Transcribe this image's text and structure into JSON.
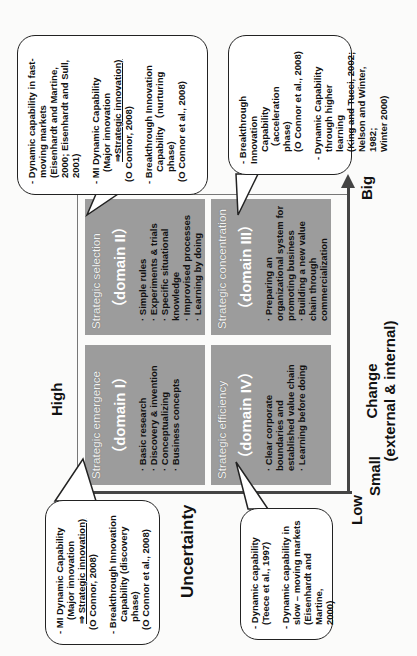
{
  "diagram": {
    "axes": {
      "x_axis": {
        "title": "Change",
        "subtitle": "(external & internal)",
        "low_label": "Small",
        "high_label": "Big"
      },
      "y_axis": {
        "title": "Uncertainty",
        "low_label": "Low",
        "high_label": "High"
      }
    },
    "quadrants": [
      {
        "id": "I",
        "title": "Strategic emergence",
        "domain": "（domain I）",
        "items": [
          "Basic research",
          "Discovery & invention",
          "Conceptualizing",
          "Business concepts"
        ]
      },
      {
        "id": "II",
        "title": "Strategic selection",
        "domain": "（domain II）",
        "items": [
          "Simple rules",
          "Experiments & trials",
          "Specific situational knowledge",
          "Improvised processes",
          "Learning by doing"
        ]
      },
      {
        "id": "III",
        "title": "Strategic concentration",
        "domain": "（domain III）",
        "items": [
          "Preparing an organizational system for promoting business",
          "Building a new value chain through commercialization"
        ]
      },
      {
        "id": "IV",
        "title": "Strategic efficiency",
        "domain": "（domain IV）",
        "items": [
          "Clear corporate boundaries and established value chain",
          "Learning before doing"
        ]
      }
    ],
    "callouts": {
      "domain_I": {
        "lines": [
          "- MI Dynamic Capability",
          "(Major innovation",
          "⇒ Strategic innovation)",
          "(O Connor, 2008)",
          "",
          "- Breakthrough Innovation",
          "Capability (discovery",
          "phase)",
          "(O Connor et al., 2008)"
        ]
      },
      "domain_II": {
        "lines": [
          "- Dynamic capability in fast-",
          "moving markets",
          "(Eisenhardt and Martine,",
          "2000; Eisenhardt and Sull,",
          "2001)",
          "",
          "- MI Dynamic Capability",
          "(Major innovation",
          "⇒Strategic innovation)",
          "(O Connor, 2008)",
          "",
          "- Breakthrough Innovation",
          "Capability （nurturing",
          "phase)",
          "(O Connor et al., 2008)"
        ]
      },
      "domain_III": {
        "lines": [
          "- Breakthrough Innovation",
          "Capability （acceleration",
          "phase)",
          "(O Connor et al., 2008)",
          "",
          "- Dynamic Capability",
          "through higher learning",
          "(King and Tucci, 2002;",
          "Nelson and Winter, 1982;",
          "Winter 2000)"
        ]
      },
      "domain_IV": {
        "lines": [
          "- Dynamic capability",
          "(Teece et al., 1997)",
          "",
          "- Dynamic capability in",
          "slow – moving markets",
          "(Eisenhardt and Martine,",
          "2000)"
        ]
      }
    },
    "colors": {
      "quadrant_fill": "#9c9c9c",
      "axis": "#444444",
      "callout_border": "#222222"
    }
  }
}
